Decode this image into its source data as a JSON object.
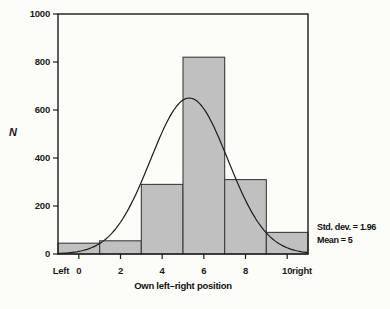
{
  "chart_data": {
    "type": "bar",
    "subtype": "histogram with fitted normal curve",
    "title": "",
    "xlabel": "Own left–right position",
    "ylabel": "N",
    "categories": [
      0,
      2,
      4,
      6,
      8,
      10
    ],
    "values": [
      45,
      55,
      290,
      820,
      310,
      90
    ],
    "bar_width": 2,
    "xlim": [
      -1,
      11
    ],
    "ylim": [
      0,
      1000
    ],
    "x_ticks": [
      0,
      2,
      4,
      6,
      8,
      10
    ],
    "x_end_labels": {
      "left": "Left",
      "right": "right"
    },
    "y_ticks": [
      0,
      200,
      400,
      600,
      800,
      1000
    ],
    "grid": false,
    "legend": "none",
    "bar_fill": "#c0c0c0",
    "bar_stroke": "#3c3c3c",
    "frame_color": "#1c1c1c",
    "normal_curve": {
      "peak_x": 5.3,
      "peak_y": 650,
      "sd_units": 1.85
    },
    "annotations": {
      "std_dev": 1.96,
      "mean": 5,
      "std_dev_label": "Std. dev. = 1.96",
      "mean_label": "Mean = 5"
    }
  }
}
